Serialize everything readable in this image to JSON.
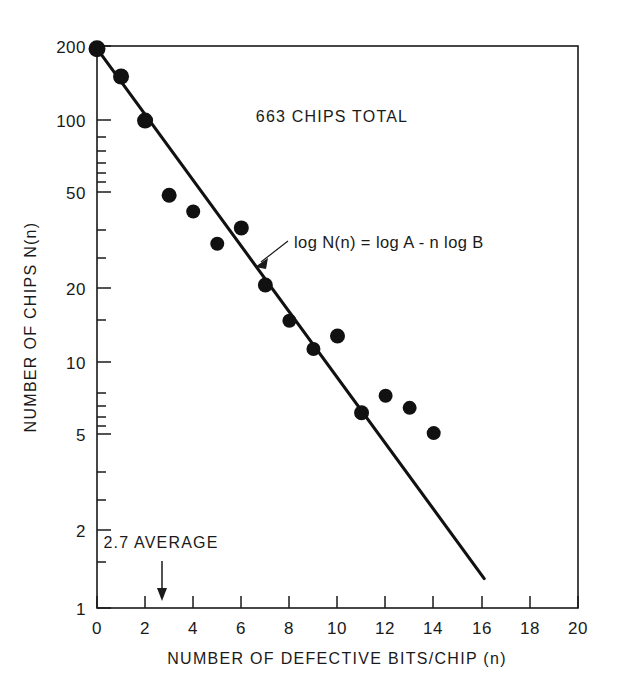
{
  "chart_data": {
    "type": "scatter",
    "title": "",
    "xlabel": "NUMBER OF DEFECTIVE BITS/CHIP (n)",
    "ylabel": "NUMBER OF CHIPS N(n)",
    "yscale": "log",
    "xlim": [
      0,
      20
    ],
    "ylim": [
      1,
      200
    ],
    "grid": false,
    "legend": null,
    "x": [
      0,
      1,
      2,
      3,
      4,
      5,
      6,
      7,
      8,
      9,
      10,
      11,
      12,
      13,
      14
    ],
    "values": [
      195,
      150,
      99,
      49,
      42,
      31,
      36,
      21,
      15,
      11.5,
      13,
      6.3,
      7.4,
      6.6,
      5.2
    ],
    "xticks": [
      0,
      2,
      4,
      6,
      8,
      10,
      12,
      14,
      16,
      18,
      20
    ],
    "xticklabels": [
      "0",
      "2",
      "4",
      "6",
      "8",
      "10",
      "12",
      "14",
      "16",
      "18",
      "20"
    ],
    "yticks": [
      1,
      2,
      5,
      10,
      20,
      50,
      100,
      200
    ],
    "yticklabels": [
      "1",
      "2",
      "5",
      "10",
      "20",
      "50",
      "100",
      "200"
    ],
    "yminorticks": [
      3,
      4,
      6,
      7,
      8,
      9,
      30,
      40,
      60,
      70,
      80,
      90,
      150
    ],
    "fit_line": {
      "label": "log N(n) = log A - n log B",
      "x_start": 0,
      "y_start": 195,
      "x_end": 16.1,
      "y_end": 1.32
    },
    "annotations": [
      {
        "name": "total-chips",
        "text": "663 CHIPS TOTAL",
        "x": 9.2,
        "y": 112
      },
      {
        "name": "fit-equation",
        "text": "log N(n) = log A - n log B",
        "x": 9.1,
        "y": 26.5
      },
      {
        "name": "average-marker",
        "text": "2.7 AVERAGE",
        "x": 2.7,
        "y": 1.75
      }
    ]
  },
  "axes": {
    "x_title": "NUMBER OF DEFECTIVE BITS/CHIP (n)",
    "y_title": "NUMBER OF CHIPS N(n)"
  },
  "labels": {
    "y": {
      "t200": "200",
      "t100": "100",
      "t50": "50",
      "t20": "20",
      "t10": "10",
      "t5": "5",
      "t2": "2",
      "t1": "1"
    },
    "x": {
      "t0": "0",
      "t2": "2",
      "t4": "4",
      "t6": "6",
      "t8": "8",
      "t10": "10",
      "t12": "12",
      "t14": "14",
      "t16": "16",
      "t18": "18",
      "t20": "20"
    }
  },
  "text": {
    "total_chips": "663 CHIPS TOTAL",
    "equation": "log N(n) = log A - n log B",
    "average": "2.7 AVERAGE"
  },
  "colors": {
    "ink": "#111111",
    "background": "#ffffff"
  }
}
